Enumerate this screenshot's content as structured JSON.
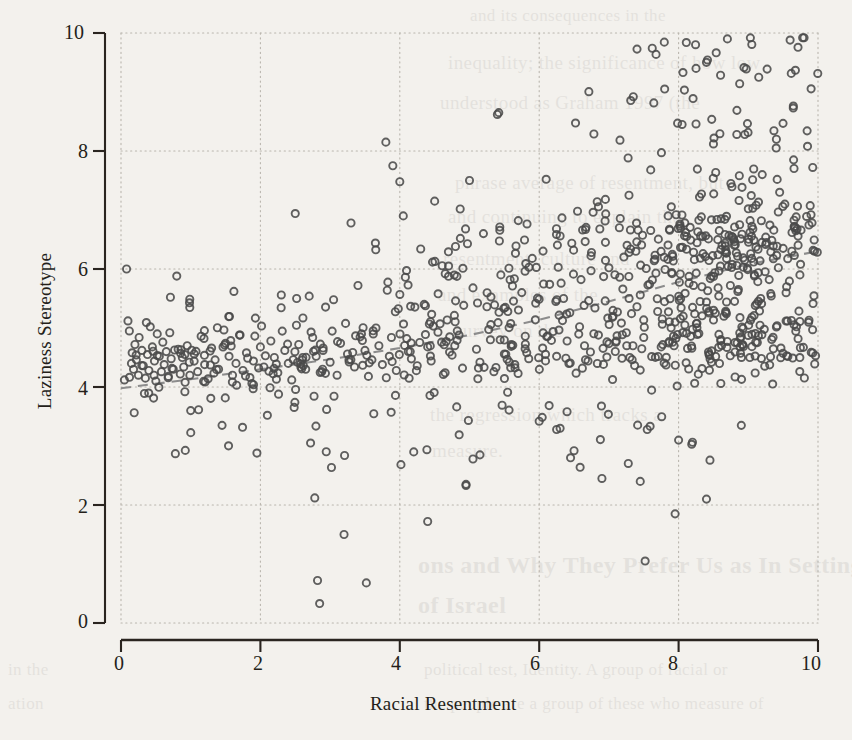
{
  "chart": {
    "type": "scatter",
    "title": "",
    "xlabel": "Racial Resentment",
    "ylabel": "Laziness Stereotype",
    "x_ticks": [
      "0",
      "2",
      "4",
      "6",
      "8",
      "10"
    ],
    "y_ticks": [
      "0",
      "2",
      "4",
      "6",
      "8",
      "10"
    ],
    "background_color": "#f3f1ed",
    "marker_color": "#4a4a4a",
    "trendline_color": "#8c8c8c",
    "grid_color": "#b9b5ad"
  },
  "chart_data": {
    "type": "scatter",
    "title": "",
    "xlabel": "Racial Resentment",
    "ylabel": "Laziness Stereotype",
    "xlim": [
      0,
      10
    ],
    "ylim": [
      0,
      10
    ],
    "xticks": [
      0,
      2,
      4,
      6,
      8,
      10
    ],
    "yticks": [
      0,
      2,
      4,
      6,
      8,
      10
    ],
    "grid": true,
    "grid_style": "dotted",
    "legend": null,
    "marker": "open-circle",
    "n_points": 760,
    "trendline": {
      "style": "dashed",
      "color": "#8c8c8c",
      "x": [
        0.0,
        1.0,
        2.0,
        3.0,
        4.0,
        5.0,
        6.0,
        7.0,
        8.0,
        9.0,
        10.0
      ],
      "y": [
        3.98,
        4.13,
        4.3,
        4.47,
        4.66,
        4.88,
        5.14,
        5.45,
        5.78,
        6.08,
        6.3
      ]
    },
    "note": "points generated from the described joint distribution; dense band near y=4.2-5.0 across all x, upper cluster emerging near x>6 around y=6.0-7.5, sparse low-y outliers concentrated at x=2.5-8",
    "clusters": [
      {
        "name": "main-band",
        "x_range": [
          0,
          10
        ],
        "y_center_at_x0": 4.45,
        "y_center_at_x10": 4.9,
        "y_spread": 0.42,
        "share": 0.55
      },
      {
        "name": "upper-band",
        "x_range": [
          3,
          10
        ],
        "y_center_at_x3": 5.6,
        "y_center_at_x10": 6.6,
        "y_spread": 0.55,
        "share": 0.33
      },
      {
        "name": "high-tail",
        "x_range": [
          5,
          10
        ],
        "y_range": [
          7.5,
          10.0
        ],
        "share": 0.07
      },
      {
        "name": "low-outliers",
        "x_range": [
          0.5,
          8.5
        ],
        "y_range": [
          0.3,
          3.6
        ],
        "share": 0.05
      }
    ],
    "points": [
      [
        0.08,
        6.0
      ],
      [
        0.1,
        5.12
      ],
      [
        0.12,
        4.95
      ],
      [
        0.15,
        4.4
      ],
      [
        0.16,
        4.58
      ],
      [
        0.18,
        4.3
      ],
      [
        0.2,
        4.72
      ],
      [
        0.22,
        4.46
      ],
      [
        0.25,
        4.2
      ],
      [
        0.26,
        4.84
      ],
      [
        0.3,
        4.62
      ],
      [
        0.32,
        4.36
      ],
      [
        0.35,
        4.15
      ],
      [
        0.38,
        4.55
      ],
      [
        0.4,
        4.28
      ],
      [
        0.42,
        5.02
      ],
      [
        0.45,
        4.68
      ],
      [
        0.48,
        4.44
      ],
      [
        0.5,
        4.1
      ],
      [
        0.52,
        4.9
      ],
      [
        0.55,
        4.52
      ],
      [
        0.58,
        4.26
      ],
      [
        0.6,
        4.76
      ],
      [
        0.62,
        4.38
      ],
      [
        0.65,
        4.6
      ],
      [
        0.68,
        4.18
      ],
      [
        0.7,
        4.92
      ],
      [
        0.72,
        4.48
      ],
      [
        0.75,
        4.3
      ],
      [
        0.78,
        2.87
      ],
      [
        0.8,
        5.88
      ],
      [
        0.82,
        4.64
      ],
      [
        0.85,
        4.22
      ],
      [
        0.88,
        4.5
      ],
      [
        0.9,
        4.34
      ],
      [
        0.92,
        4.08
      ],
      [
        0.95,
        4.7
      ],
      [
        0.98,
        4.42
      ],
      [
        1.0,
        3.6
      ],
      [
        1.05,
        4.56
      ],
      [
        1.1,
        4.26
      ],
      [
        1.15,
        4.86
      ],
      [
        1.2,
        4.38
      ],
      [
        1.25,
        4.14
      ],
      [
        1.3,
        4.66
      ],
      [
        1.35,
        4.46
      ],
      [
        1.4,
        4.3
      ],
      [
        1.45,
        3.35
      ],
      [
        1.5,
        4.74
      ],
      [
        1.55,
        4.52
      ],
      [
        1.6,
        4.2
      ],
      [
        1.62,
        5.62
      ],
      [
        1.65,
        4.4
      ],
      [
        1.7,
        4.88
      ],
      [
        1.75,
        4.28
      ],
      [
        1.8,
        4.58
      ],
      [
        1.85,
        4.16
      ],
      [
        1.9,
        4.44
      ],
      [
        1.95,
        2.88
      ],
      [
        2.0,
        4.68
      ],
      [
        2.05,
        4.34
      ],
      [
        2.1,
        3.52
      ],
      [
        2.15,
        4.78
      ],
      [
        2.2,
        4.5
      ],
      [
        2.25,
        4.24
      ],
      [
        2.3,
        5.56
      ],
      [
        2.35,
        4.62
      ],
      [
        2.4,
        4.4
      ],
      [
        2.45,
        4.12
      ],
      [
        2.5,
        6.94
      ],
      [
        2.52,
        5.5
      ],
      [
        2.55,
        4.72
      ],
      [
        2.6,
        4.46
      ],
      [
        2.65,
        4.3
      ],
      [
        2.7,
        5.54
      ],
      [
        2.72,
        3.05
      ],
      [
        2.75,
        4.84
      ],
      [
        2.78,
        2.12
      ],
      [
        2.8,
        4.52
      ],
      [
        2.82,
        0.72
      ],
      [
        2.85,
        0.33
      ],
      [
        2.88,
        4.26
      ],
      [
        2.9,
        4.66
      ],
      [
        2.95,
        3.62
      ],
      [
        3.0,
        4.42
      ],
      [
        3.05,
        5.48
      ],
      [
        3.1,
        4.2
      ],
      [
        3.15,
        4.74
      ],
      [
        3.2,
        1.5
      ],
      [
        3.25,
        4.56
      ],
      [
        3.3,
        6.78
      ],
      [
        3.35,
        4.34
      ],
      [
        3.4,
        5.72
      ],
      [
        3.45,
        4.9
      ],
      [
        3.5,
        4.62
      ],
      [
        3.52,
        0.68
      ],
      [
        3.55,
        4.18
      ],
      [
        3.6,
        4.46
      ],
      [
        3.65,
        6.44
      ],
      [
        3.7,
        4.7
      ],
      [
        3.75,
        4.38
      ],
      [
        3.8,
        8.15
      ],
      [
        3.82,
        5.64
      ],
      [
        3.85,
        4.52
      ],
      [
        3.9,
        7.75
      ],
      [
        3.95,
        4.28
      ],
      [
        4.0,
        7.48
      ],
      [
        4.05,
        6.9
      ],
      [
        4.08,
        5.86
      ],
      [
        4.1,
        4.82
      ],
      [
        4.15,
        4.6
      ],
      [
        4.2,
        2.9
      ],
      [
        4.25,
        4.36
      ],
      [
        4.3,
        6.34
      ],
      [
        4.35,
        5.4
      ],
      [
        4.4,
        4.68
      ],
      [
        4.45,
        4.44
      ],
      [
        4.5,
        7.15
      ],
      [
        4.55,
        5.58
      ],
      [
        4.6,
        4.76
      ],
      [
        4.65,
        4.24
      ],
      [
        4.7,
        6.05
      ],
      [
        4.75,
        4.54
      ],
      [
        4.8,
        5.46
      ],
      [
        4.85,
        4.88
      ],
      [
        4.9,
        4.32
      ],
      [
        4.95,
        2.33
      ],
      [
        5.0,
        7.5
      ],
      [
        5.05,
        5.68
      ],
      [
        5.1,
        4.64
      ],
      [
        5.15,
        4.42
      ],
      [
        5.2,
        6.6
      ],
      [
        5.25,
        5.36
      ],
      [
        5.3,
        4.8
      ],
      [
        5.35,
        4.26
      ],
      [
        5.4,
        8.62
      ],
      [
        5.42,
        8.65
      ],
      [
        5.45,
        5.9
      ],
      [
        5.5,
        4.56
      ],
      [
        5.55,
        5.28
      ],
      [
        5.6,
        4.72
      ],
      [
        5.65,
        4.38
      ],
      [
        5.7,
        6.82
      ],
      [
        5.75,
        5.6
      ],
      [
        5.8,
        4.86
      ],
      [
        5.85,
        4.48
      ],
      [
        5.9,
        6.18
      ],
      [
        5.95,
        5.42
      ],
      [
        6.0,
        3.42
      ],
      [
        6.05,
        4.66
      ],
      [
        6.1,
        7.52
      ],
      [
        6.15,
        5.74
      ],
      [
        6.2,
        4.94
      ],
      [
        6.25,
        4.52
      ],
      [
        6.3,
        6.56
      ],
      [
        6.35,
        5.5
      ],
      [
        6.4,
        4.78
      ],
      [
        6.45,
        2.8
      ],
      [
        6.5,
        2.92
      ],
      [
        6.55,
        6.98
      ],
      [
        6.6,
        5.82
      ],
      [
        6.65,
        4.7
      ],
      [
        6.7,
        4.44
      ],
      [
        6.75,
        6.28
      ],
      [
        6.8,
        5.34
      ],
      [
        6.85,
        4.88
      ],
      [
        6.9,
        2.45
      ],
      [
        6.95,
        7.18
      ],
      [
        7.0,
        6.02
      ],
      [
        7.05,
        5.18
      ],
      [
        7.1,
        4.76
      ],
      [
        7.15,
        6.7
      ],
      [
        7.2,
        5.66
      ],
      [
        7.25,
        4.92
      ],
      [
        7.3,
        4.5
      ],
      [
        7.35,
        8.92
      ],
      [
        7.4,
        6.46
      ],
      [
        7.45,
        5.56
      ],
      [
        7.5,
        4.84
      ],
      [
        7.55,
        3.28
      ],
      [
        7.6,
        7.68
      ],
      [
        7.65,
        6.14
      ],
      [
        7.7,
        5.28
      ],
      [
        7.75,
        4.68
      ],
      [
        7.8,
        9.05
      ],
      [
        7.85,
        6.9
      ],
      [
        7.9,
        5.94
      ],
      [
        7.95,
        5.1
      ],
      [
        8.0,
        3.1
      ],
      [
        8.05,
        8.45
      ],
      [
        8.1,
        6.62
      ],
      [
        8.15,
        5.76
      ],
      [
        8.2,
        4.98
      ],
      [
        8.25,
        9.4
      ],
      [
        8.3,
        7.22
      ],
      [
        8.35,
        6.26
      ],
      [
        8.4,
        5.44
      ],
      [
        8.45,
        2.76
      ],
      [
        8.5,
        8.12
      ],
      [
        8.55,
        6.84
      ],
      [
        8.6,
        6.05
      ],
      [
        8.65,
        5.2
      ],
      [
        8.7,
        9.9
      ],
      [
        8.75,
        7.45
      ],
      [
        8.8,
        6.4
      ],
      [
        8.85,
        5.62
      ],
      [
        8.9,
        3.35
      ],
      [
        8.95,
        8.28
      ],
      [
        9.0,
        7.02
      ],
      [
        9.05,
        6.18
      ],
      [
        9.1,
        5.38
      ],
      [
        9.15,
        9.25
      ],
      [
        9.2,
        7.6
      ],
      [
        9.25,
        6.54
      ],
      [
        9.3,
        5.82
      ],
      [
        9.35,
        4.05
      ],
      [
        9.4,
        8.05
      ],
      [
        9.45,
        7.3
      ],
      [
        9.5,
        6.35
      ],
      [
        9.55,
        5.7
      ],
      [
        9.6,
        9.88
      ],
      [
        9.65,
        7.85
      ],
      [
        9.7,
        6.68
      ],
      [
        9.75,
        6.08
      ],
      [
        9.8,
        9.92
      ],
      [
        9.85,
        8.08
      ],
      [
        9.9,
        6.92
      ],
      [
        9.95,
        6.3
      ],
      [
        7.52,
        1.05
      ],
      [
        7.95,
        1.85
      ],
      [
        8.4,
        2.1
      ],
      [
        7.45,
        2.4
      ],
      [
        6.25,
        3.28
      ],
      [
        6.3,
        3.3
      ],
      [
        5.05,
        2.78
      ],
      [
        5.15,
        2.85
      ],
      [
        4.95,
        2.35
      ],
      [
        4.4,
        1.72
      ]
    ]
  }
}
